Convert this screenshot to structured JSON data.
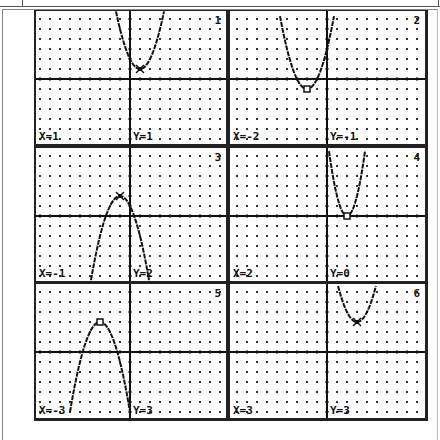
{
  "top_strip": {
    "cut_text_fragments": [
      "",
      ""
    ]
  },
  "colors": {
    "ink": "#111111",
    "dot": "#333333",
    "background": "#ffffff",
    "frame": "#222222"
  },
  "window": {
    "xmin": -9.4,
    "xmax": 9.4,
    "ymin": -6.6,
    "ymax": 6.6,
    "grid_step": 1
  },
  "panels": [
    {
      "number": "1",
      "x_label": "X=1",
      "y_label": "Y=1",
      "a": 1,
      "h": 1,
      "k": 1,
      "marker": "cross"
    },
    {
      "number": "2",
      "x_label": "X=-2",
      "y_label": "Y=-1",
      "a": 1,
      "h": -2,
      "k": -1,
      "marker": "square"
    },
    {
      "number": "3",
      "x_label": "X=-1",
      "y_label": "Y=2",
      "a": -1,
      "h": -1,
      "k": 2,
      "marker": "cross"
    },
    {
      "number": "4",
      "x_label": "X=2",
      "y_label": "Y=0",
      "a": 2,
      "h": 2,
      "k": 0,
      "marker": "square"
    },
    {
      "number": "5",
      "x_label": "X=-3",
      "y_label": "Y=3",
      "a": -1,
      "h": -3,
      "k": 3,
      "marker": "square"
    },
    {
      "number": "6",
      "x_label": "X=3",
      "y_label": "Y=3",
      "a": 1,
      "h": 3,
      "k": 3,
      "marker": "cross"
    }
  ],
  "chart_data": [
    {
      "type": "line",
      "title": "1",
      "equation": "y = (x-1)^2 + 1",
      "vertex": [
        1,
        1
      ],
      "trace_point": {
        "x": 1,
        "y": 1
      },
      "xlim": [
        -9.4,
        9.4
      ],
      "ylim": [
        -6.6,
        6.6
      ],
      "grid": true
    },
    {
      "type": "line",
      "title": "2",
      "equation": "y = (x+2)^2 - 1",
      "vertex": [
        -2,
        -1
      ],
      "trace_point": {
        "x": -2,
        "y": -1
      },
      "xlim": [
        -9.4,
        9.4
      ],
      "ylim": [
        -6.6,
        6.6
      ],
      "grid": true
    },
    {
      "type": "line",
      "title": "3",
      "equation": "y = -(x+1)^2 + 2",
      "vertex": [
        -1,
        2
      ],
      "trace_point": {
        "x": -1,
        "y": 2
      },
      "xlim": [
        -9.4,
        9.4
      ],
      "ylim": [
        -6.6,
        6.6
      ],
      "grid": true
    },
    {
      "type": "line",
      "title": "4",
      "equation": "y = 2(x-2)^2",
      "vertex": [
        2,
        0
      ],
      "trace_point": {
        "x": 2,
        "y": 0
      },
      "xlim": [
        -9.4,
        9.4
      ],
      "ylim": [
        -6.6,
        6.6
      ],
      "grid": true
    },
    {
      "type": "line",
      "title": "5",
      "equation": "y = -(x+3)^2 + 3",
      "vertex": [
        -3,
        3
      ],
      "trace_point": {
        "x": -3,
        "y": 3
      },
      "xlim": [
        -9.4,
        9.4
      ],
      "ylim": [
        -6.6,
        6.6
      ],
      "grid": true
    },
    {
      "type": "line",
      "title": "6",
      "equation": "y = (x-3)^2 + 3",
      "vertex": [
        3,
        3
      ],
      "trace_point": {
        "x": 3,
        "y": 3
      },
      "xlim": [
        -9.4,
        9.4
      ],
      "ylim": [
        -6.6,
        6.6
      ],
      "grid": true
    }
  ]
}
